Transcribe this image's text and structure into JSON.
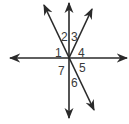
{
  "diagram": {
    "type": "intersecting-lines-angles",
    "center": [
      69,
      58
    ],
    "line_color": "#2a2a2a",
    "label_color": "#3a3a3a",
    "lines": [
      {
        "name": "horizontal-line",
        "from": [
          10,
          58
        ],
        "to": [
          127,
          58
        ],
        "arrows": "both"
      },
      {
        "name": "vertical-line",
        "from": [
          69,
          3
        ],
        "to": [
          69,
          118
        ],
        "arrows": "both"
      },
      {
        "name": "diagonal-line",
        "from": [
          44,
          5
        ],
        "to": [
          94,
          110
        ],
        "arrows": "both"
      },
      {
        "name": "ray-up-right",
        "from": [
          69,
          58
        ],
        "to": [
          92,
          9
        ],
        "arrows": "end"
      }
    ],
    "angle_labels": [
      {
        "text": "1",
        "x": 55,
        "y": 57
      },
      {
        "text": "2",
        "x": 61,
        "y": 41
      },
      {
        "text": "3",
        "x": 71,
        "y": 41
      },
      {
        "text": "4",
        "x": 78,
        "y": 57
      },
      {
        "text": "5",
        "x": 79,
        "y": 72
      },
      {
        "text": "6",
        "x": 71,
        "y": 87
      },
      {
        "text": "7",
        "x": 58,
        "y": 75
      }
    ]
  }
}
